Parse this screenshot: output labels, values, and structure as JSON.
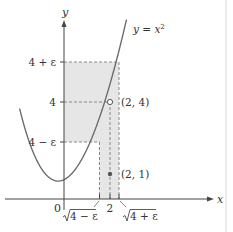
{
  "figure": {
    "curve_label": "y = x",
    "curve_label_exp": "2",
    "axis_x_label": "x",
    "axis_y_label": "y",
    "origin_label": "0",
    "y_ticks": {
      "upper": "4 + ε",
      "middle": "4",
      "lower": "4 − ε"
    },
    "x_ticks": {
      "left": "√4 − ε",
      "left_radicand": "4 − ε",
      "middle": "2",
      "right": "√4 + ε",
      "right_radicand": "4 + ε"
    },
    "points": {
      "open": "(2, 4)",
      "filled": "(2, 1)"
    },
    "colors": {
      "shade": "#e6e6e6",
      "curve": "#6b6b6b",
      "axis": "#444444",
      "dash": "#888888",
      "point": "#555555"
    }
  }
}
